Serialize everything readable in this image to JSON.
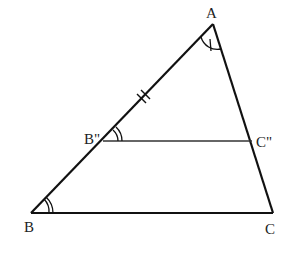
{
  "diagram": {
    "title": "",
    "colors": {
      "stroke": "#111111",
      "thin_stroke": "#333333",
      "label": "#222222",
      "background": "#ffffff"
    },
    "points": {
      "A": {
        "label": "A",
        "x": 213,
        "y": 24
      },
      "B": {
        "label": "B",
        "x": 31,
        "y": 213
      },
      "C": {
        "label": "C",
        "x": 273,
        "y": 213
      },
      "B2": {
        "label": "B\"",
        "x": 103,
        "y": 141
      },
      "C2": {
        "label": "C\"",
        "x": 252,
        "y": 141
      }
    },
    "segments": [
      {
        "name": "AB",
        "from": "A",
        "to": "B"
      },
      {
        "name": "AC",
        "from": "A",
        "to": "C"
      },
      {
        "name": "BC",
        "from": "B",
        "to": "C"
      },
      {
        "name": "B\"C\"",
        "from": "B2",
        "to": "C2"
      }
    ],
    "marks": {
      "angle_A": "single arc with tick",
      "angle_B": "double arc",
      "angle_B2": "double arc",
      "segment_AB2": "double tick"
    }
  }
}
